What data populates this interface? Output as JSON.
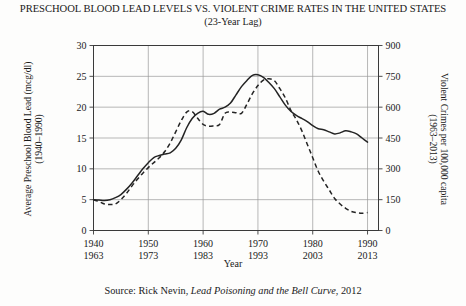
{
  "header": {
    "title": "PRESCHOOL BLOOD LEAD LEVELS VS. VIOLENT CRIME RATES IN THE UNITED STATES",
    "subtitle": "(23-Year Lag)"
  },
  "footer": {
    "source_prefix": "Source: Rick Nevin, ",
    "source_book": "Lead Poisoning and the Bell Curve",
    "source_suffix": ", 2012"
  },
  "chart_data": {
    "type": "line",
    "title": "PRESCHOOL BLOOD LEAD LEVELS VS. VIOLENT CRIME RATES IN THE UNITED STATES",
    "subtitle": "(23-Year Lag)",
    "xlabel": "Year",
    "grid": true,
    "legend": "none",
    "x_axis": {
      "label": "Year",
      "range": [
        1940,
        1992
      ],
      "ticks": [
        1940,
        1950,
        1960,
        1970,
        1980,
        1990
      ],
      "tick_labels_primary": [
        "1940",
        "1950",
        "1960",
        "1970",
        "1980",
        "1990"
      ],
      "tick_labels_secondary": [
        "1963",
        "1973",
        "1983",
        "1993",
        "2003",
        "2013"
      ]
    },
    "y_left": {
      "label": "Average Preschool Blood Lead (mcg/dl)",
      "sublabel": "(1940–1990)",
      "range": [
        0,
        30
      ],
      "ticks": [
        0,
        5,
        10,
        15,
        20,
        25,
        30
      ],
      "tick_labels": [
        "0",
        "5",
        "10",
        "15",
        "20",
        "25",
        "30"
      ],
      "series_style": "dashed"
    },
    "y_right": {
      "label": "Violent Crimes per 100,000 capita",
      "sublabel": "(1963–2013)",
      "range": [
        0,
        900
      ],
      "ticks": [
        0,
        150,
        300,
        450,
        600,
        750,
        900
      ],
      "tick_labels": [
        "0",
        "150",
        "300",
        "450",
        "600",
        "750",
        "900"
      ],
      "series_style": "solid"
    },
    "series": [
      {
        "name": "Violent Crimes per 100,000 capita (1963-2013)",
        "axis": "right",
        "style": "solid",
        "x": [
          1940,
          1941,
          1942,
          1943,
          1944,
          1945,
          1946,
          1947,
          1948,
          1949,
          1950,
          1951,
          1952,
          1953,
          1954,
          1955,
          1956,
          1957,
          1958,
          1959,
          1960,
          1961,
          1962,
          1963,
          1964,
          1965,
          1966,
          1967,
          1968,
          1969,
          1970,
          1971,
          1972,
          1973,
          1974,
          1975,
          1976,
          1977,
          1978,
          1979,
          1980,
          1981,
          1982,
          1983,
          1984,
          1985,
          1986,
          1987,
          1988,
          1989,
          1990
        ],
        "values": [
          150,
          148,
          146,
          150,
          160,
          175,
          200,
          230,
          265,
          300,
          330,
          355,
          365,
          372,
          378,
          400,
          440,
          500,
          545,
          570,
          580,
          565,
          570,
          590,
          600,
          620,
          660,
          700,
          730,
          755,
          758,
          745,
          720,
          690,
          650,
          610,
          580,
          560,
          545,
          530,
          510,
          495,
          490,
          480,
          470,
          475,
          485,
          480,
          470,
          450,
          430
        ]
      },
      {
        "name": "Average Preschool Blood Lead (mcg/dl) (1940-1990)",
        "axis": "left",
        "style": "dashed",
        "x": [
          1940,
          1941,
          1942,
          1943,
          1944,
          1945,
          1946,
          1947,
          1948,
          1949,
          1950,
          1951,
          1952,
          1953,
          1954,
          1955,
          1956,
          1957,
          1958,
          1959,
          1960,
          1961,
          1962,
          1963,
          1964,
          1965,
          1966,
          1967,
          1968,
          1969,
          1970,
          1971,
          1972,
          1973,
          1974,
          1975,
          1976,
          1977,
          1978,
          1979,
          1980,
          1981,
          1982,
          1983,
          1984,
          1985,
          1986,
          1987,
          1988,
          1989,
          1990
        ],
        "values": [
          5.0,
          4.7,
          4.3,
          4.2,
          4.3,
          5.0,
          6.0,
          7.2,
          8.3,
          9.3,
          10.2,
          11.0,
          11.8,
          12.8,
          14.2,
          16.0,
          17.8,
          19.2,
          19.3,
          18.2,
          17.2,
          16.9,
          17.0,
          17.2,
          19.0,
          19.2,
          19.1,
          19.0,
          20.5,
          22.2,
          23.5,
          24.4,
          24.6,
          24.3,
          23.0,
          21.5,
          19.5,
          18.0,
          16.2,
          14.0,
          11.8,
          9.6,
          8.0,
          6.6,
          5.2,
          4.3,
          3.6,
          3.1,
          2.9,
          2.8,
          2.9
        ]
      }
    ]
  }
}
